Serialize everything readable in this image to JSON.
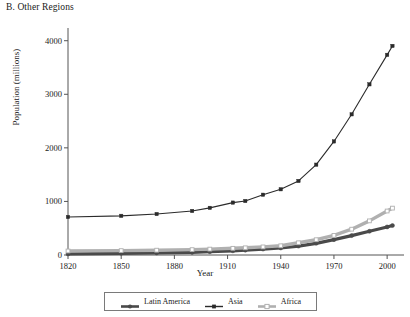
{
  "panel": {
    "title": "B. Other Regions"
  },
  "chart_data": {
    "type": "line",
    "title": "B. Other Regions",
    "xlabel": "Year",
    "ylabel": "Population (millions)",
    "xlim": [
      1820,
      2005
    ],
    "ylim": [
      0,
      4200
    ],
    "xticks": [
      1820,
      1850,
      1880,
      1910,
      1940,
      1970,
      2000
    ],
    "yticks": [
      0,
      1000,
      2000,
      3000,
      4000
    ],
    "xtick_labels": [
      "1820",
      "1850",
      "1880",
      "1910",
      "1940",
      "1970",
      "2000"
    ],
    "ytick_labels": [
      "0",
      "1000",
      "2000",
      "3000",
      "4000"
    ],
    "grid": false,
    "legend_position": "below-center",
    "x": [
      1820,
      1850,
      1870,
      1890,
      1900,
      1913,
      1920,
      1930,
      1940,
      1950,
      1960,
      1970,
      1980,
      1990,
      2000,
      2003
    ],
    "series": [
      {
        "name": "Latin America",
        "marker": "filled-circle",
        "color": "#4a4a4a",
        "values": [
          20,
          31,
          38,
          49,
          61,
          78,
          91,
          110,
          131,
          166,
          218,
          287,
          362,
          443,
          524,
          550
        ]
      },
      {
        "name": "Asia",
        "marker": "filled-square",
        "color": "#2b2b2b",
        "values": [
          710,
          731,
          765,
          822,
          880,
          978,
          1008,
          1125,
          1227,
          1382,
          1686,
          2120,
          2626,
          3186,
          3736,
          3903
        ]
      },
      {
        "name": "Africa",
        "marker": "open-square",
        "color": "#b0b0b0",
        "values": [
          75,
          82,
          90,
          100,
          110,
          125,
          134,
          151,
          172,
          228,
          285,
          366,
          482,
          637,
          821,
          875
        ]
      }
    ]
  },
  "legend": {
    "items": [
      {
        "label": "Latin America",
        "marker": "filled-circle",
        "color": "#4a4a4a"
      },
      {
        "label": "Asia",
        "marker": "filled-square",
        "color": "#2b2b2b"
      },
      {
        "label": "Africa",
        "marker": "open-square",
        "color": "#b0b0b0"
      }
    ]
  },
  "axes": {
    "x_title": "Year",
    "y_title": "Population (millions)"
  }
}
